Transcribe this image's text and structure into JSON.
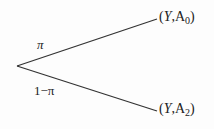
{
  "diagram": {
    "type": "probability-tree",
    "root": {
      "x": 17,
      "y": 66
    },
    "branches": [
      {
        "probability": "π",
        "outcome": {
          "var": "Y",
          "sep": ",",
          "label": "A",
          "sub": "0"
        },
        "end": {
          "x": 157,
          "y": 19
        }
      },
      {
        "probability": "1−π",
        "outcome": {
          "var": "Y",
          "sep": ",",
          "label": "A",
          "sub": "2"
        },
        "end": {
          "x": 157,
          "y": 111
        }
      }
    ]
  },
  "colors": {
    "line": "#333333",
    "text": "#222222"
  }
}
